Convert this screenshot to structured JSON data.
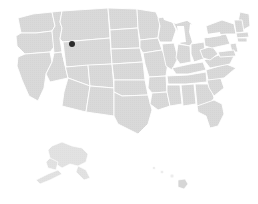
{
  "figure": {
    "kind": "choropleth-map",
    "region": "United States",
    "width": 258,
    "height": 204,
    "background_color": "#ffffff"
  },
  "map": {
    "land_fill": "#d9d9d9",
    "land_fill_light": "#dedede",
    "border_color": "#ffffff",
    "lake_fill": "#ffffff",
    "texture": "halftone-dots",
    "texture_opacity": 0.35,
    "insets": [
      {
        "name": "alaska",
        "label": "Alaska",
        "fill": "#dcdcdc"
      },
      {
        "name": "hawaii",
        "label": "Hawaii",
        "fill": "#e6e6e6"
      }
    ]
  },
  "markers": [
    {
      "id": "marker-1",
      "state": "Montana",
      "x": 72,
      "y": 44,
      "size": 6,
      "color": "#2b2b2b"
    }
  ]
}
